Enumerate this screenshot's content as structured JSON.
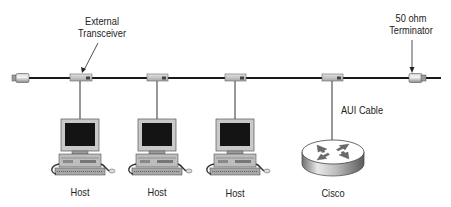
{
  "diagram": {
    "title_callouts": {
      "external_transceiver": "External\nTransceiver",
      "external_transceiver_line1": "External",
      "external_transceiver_line2": "Transceiver",
      "terminator_line1": "50 ohm",
      "terminator_line2": "Terminator",
      "aui_cable": "AUI Cable"
    },
    "backbone": {
      "type": "thick-ethernet-coax",
      "color": "#1a1a1a"
    },
    "nodes": [
      {
        "id": "host-1",
        "type": "host",
        "label": "Host"
      },
      {
        "id": "host-2",
        "type": "host",
        "label": "Host"
      },
      {
        "id": "host-3",
        "type": "host",
        "label": "Host"
      },
      {
        "id": "cisco",
        "type": "router",
        "label": "Cisco"
      }
    ],
    "transceivers": 4,
    "terminators": 2,
    "edges": [
      {
        "from": "backbone",
        "to": "host-1",
        "via": "transceiver"
      },
      {
        "from": "backbone",
        "to": "host-2",
        "via": "transceiver"
      },
      {
        "from": "backbone",
        "to": "host-3",
        "via": "transceiver"
      },
      {
        "from": "backbone",
        "to": "cisco",
        "via": "AUI Cable"
      }
    ]
  }
}
